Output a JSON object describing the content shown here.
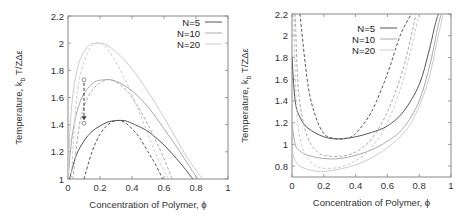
{
  "chart_data": [
    {
      "type": "line",
      "title": "",
      "xlabel": "Concentration of Polymer, ϕ",
      "ylabel": "Temperature, k_b T/ZΔε",
      "xlim": [
        0,
        1
      ],
      "ylim": [
        1,
        2.2
      ],
      "xticks": [
        "0",
        "0.2",
        "0.4",
        "0.6",
        "0.8",
        "1"
      ],
      "yticks": [
        "1",
        "1.2",
        "1.4",
        "1.6",
        "1.8",
        "2",
        "2.2"
      ],
      "grid": false,
      "legend_position": "upper right",
      "legend": [
        "N=5",
        "N=10",
        "N=20"
      ],
      "series": [
        {
          "name": "N=5 binodal",
          "style": "solid",
          "color": "#555555",
          "x": [
            0.01,
            0.05,
            0.1,
            0.15,
            0.2,
            0.25,
            0.3,
            0.35,
            0.4,
            0.5,
            0.6,
            0.7,
            0.78
          ],
          "y": [
            1.0,
            1.17,
            1.28,
            1.35,
            1.39,
            1.42,
            1.43,
            1.43,
            1.41,
            1.35,
            1.25,
            1.12,
            1.0
          ]
        },
        {
          "name": "N=5 spinodal",
          "style": "dashed",
          "color": "#555555",
          "x": [
            0.1,
            0.15,
            0.2,
            0.25,
            0.3,
            0.35,
            0.4,
            0.45,
            0.5,
            0.55,
            0.6
          ],
          "y": [
            1.0,
            1.2,
            1.33,
            1.4,
            1.43,
            1.42,
            1.37,
            1.3,
            1.2,
            1.1,
            0.98
          ]
        },
        {
          "name": "N=10 binodal",
          "style": "solid",
          "color": "#aaaaaa",
          "x": [
            0.0,
            0.03,
            0.08,
            0.15,
            0.22,
            0.3,
            0.4,
            0.5,
            0.6,
            0.7,
            0.8,
            0.82
          ],
          "y": [
            1.0,
            1.35,
            1.58,
            1.7,
            1.73,
            1.72,
            1.65,
            1.53,
            1.37,
            1.2,
            1.02,
            1.0
          ]
        },
        {
          "name": "N=10 spinodal",
          "style": "dashed",
          "color": "#aaaaaa",
          "x": [
            0.03,
            0.08,
            0.15,
            0.24,
            0.32,
            0.4,
            0.5,
            0.6,
            0.65
          ],
          "y": [
            1.0,
            1.45,
            1.65,
            1.73,
            1.7,
            1.6,
            1.4,
            1.15,
            1.0
          ]
        },
        {
          "name": "N=20 binodal",
          "style": "solid",
          "color": "#cccccc",
          "x": [
            0.0,
            0.02,
            0.06,
            0.12,
            0.18,
            0.25,
            0.35,
            0.45,
            0.55,
            0.65,
            0.75,
            0.84
          ],
          "y": [
            1.0,
            1.5,
            1.82,
            1.97,
            2.0,
            1.98,
            1.88,
            1.73,
            1.55,
            1.35,
            1.15,
            1.0
          ]
        },
        {
          "name": "N=20 spinodal",
          "style": "dashed",
          "color": "#cccccc",
          "x": [
            0.02,
            0.06,
            0.12,
            0.18,
            0.25,
            0.35,
            0.45,
            0.55,
            0.63
          ],
          "y": [
            1.0,
            1.65,
            1.92,
            2.0,
            1.95,
            1.75,
            1.48,
            1.18,
            1.0
          ]
        }
      ],
      "annotations": [
        {
          "type": "arrow",
          "style": "dashed",
          "from": [
            0.1,
            1.73
          ],
          "to": [
            0.1,
            1.41
          ],
          "markers": "open circles"
        }
      ]
    },
    {
      "type": "line",
      "title": "",
      "xlabel": "Concentration of Polymer, ϕ",
      "ylabel": "Temperature, k_b T/ZΔε",
      "xlim": [
        0,
        1
      ],
      "ylim": [
        0.7,
        2.2
      ],
      "xticks": [
        "0",
        "0.2",
        "0.4",
        "0.6",
        "0.8",
        "1"
      ],
      "yticks": [
        "0.8",
        "1",
        "1.2",
        "1.4",
        "1.6",
        "1.8",
        "2",
        "2.2"
      ],
      "grid": false,
      "legend_position": "upper center",
      "legend": [
        "N=5",
        "N=10",
        "N=20"
      ],
      "series": [
        {
          "name": "N=5 solid",
          "style": "solid",
          "color": "#555555",
          "x": [
            0.0,
            0.02,
            0.05,
            0.1,
            0.2,
            0.3,
            0.4,
            0.5,
            0.6,
            0.7,
            0.8,
            0.86,
            0.9,
            0.92
          ],
          "y": [
            1.8,
            1.4,
            1.25,
            1.15,
            1.07,
            1.05,
            1.07,
            1.11,
            1.17,
            1.3,
            1.55,
            1.85,
            2.1,
            2.2
          ]
        },
        {
          "name": "N=5 dashed",
          "style": "dashed",
          "color": "#555555",
          "x": [
            0.05,
            0.1,
            0.15,
            0.2,
            0.25,
            0.3,
            0.35,
            0.4,
            0.5,
            0.6,
            0.68,
            0.75
          ],
          "y": [
            2.2,
            1.55,
            1.25,
            1.1,
            1.06,
            1.05,
            1.06,
            1.1,
            1.3,
            1.65,
            2.0,
            2.2
          ]
        },
        {
          "name": "N=10 solid",
          "style": "solid",
          "color": "#aaaaaa",
          "x": [
            0.0,
            0.02,
            0.05,
            0.1,
            0.2,
            0.3,
            0.4,
            0.5,
            0.6,
            0.7,
            0.8,
            0.87,
            0.92,
            0.94
          ],
          "y": [
            1.2,
            1.0,
            0.94,
            0.9,
            0.87,
            0.87,
            0.9,
            0.95,
            1.03,
            1.15,
            1.4,
            1.75,
            2.1,
            2.2
          ]
        },
        {
          "name": "N=10 dashed",
          "style": "dashed",
          "color": "#aaaaaa",
          "x": [
            0.02,
            0.04,
            0.08,
            0.12,
            0.16,
            0.2,
            0.3,
            0.4,
            0.5,
            0.6,
            0.7,
            0.78
          ],
          "y": [
            2.2,
            1.5,
            1.15,
            1.0,
            0.93,
            0.9,
            0.89,
            0.93,
            1.05,
            1.3,
            1.7,
            2.2
          ]
        },
        {
          "name": "N=20 solid",
          "style": "solid",
          "color": "#cccccc",
          "x": [
            0.0,
            0.02,
            0.05,
            0.1,
            0.17,
            0.25,
            0.35,
            0.45,
            0.55,
            0.65,
            0.75,
            0.85,
            0.92,
            0.95
          ],
          "y": [
            0.95,
            0.85,
            0.8,
            0.77,
            0.75,
            0.76,
            0.79,
            0.84,
            0.92,
            1.03,
            1.2,
            1.55,
            2.0,
            2.2
          ]
        },
        {
          "name": "N=20 dashed",
          "style": "dashed",
          "color": "#cccccc",
          "x": [
            0.01,
            0.03,
            0.06,
            0.1,
            0.15,
            0.2,
            0.3,
            0.4,
            0.5,
            0.6,
            0.7,
            0.8
          ],
          "y": [
            2.2,
            1.3,
            1.0,
            0.87,
            0.8,
            0.78,
            0.79,
            0.85,
            0.97,
            1.2,
            1.6,
            2.2
          ]
        }
      ]
    }
  ]
}
